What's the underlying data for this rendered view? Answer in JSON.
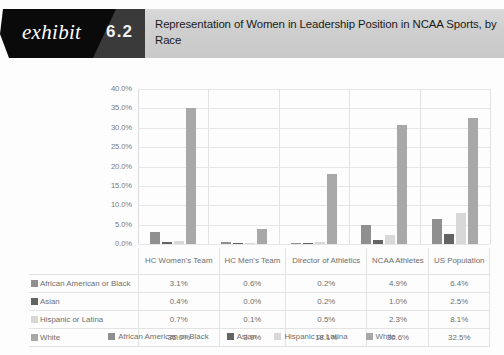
{
  "header": {
    "exhibit_word": "exhibit",
    "exhibit_number": "6.2",
    "title": "Representation of Women in Leadership Position in NCAA Sports, by Race"
  },
  "chart_data": {
    "type": "bar",
    "title": "Representation of Women in Leadership Position in NCAA Sports, by Race",
    "xlabel": "",
    "ylabel": "",
    "ylim": [
      0,
      40
    ],
    "grid": true,
    "legend_position": "bottom",
    "ytick_labels": [
      "40.0%",
      "35.0%",
      "30.0%",
      "25.0%",
      "20.0%",
      "15.0%",
      "10.0%",
      "5.0%",
      "0.0%"
    ],
    "ytick_values": [
      40,
      35,
      30,
      25,
      20,
      15,
      10,
      5,
      0
    ],
    "categories": [
      "HC Women's Team",
      "HC Men's Team",
      "Director of Athletics",
      "NCAA Athletes",
      "US Population"
    ],
    "series": [
      {
        "name": "African American or Black",
        "color": "#8f8f8f",
        "values": [
          3.1,
          0.6,
          0.2,
          4.9,
          6.4
        ],
        "labels": [
          "3.1%",
          "0.6%",
          "0.2%",
          "4.9%",
          "6.4%"
        ]
      },
      {
        "name": "Asian",
        "color": "#636363",
        "values": [
          0.4,
          0.0,
          0.2,
          1.0,
          2.5
        ],
        "labels": [
          "0.4%",
          "0.0%",
          "0.2%",
          "1.0%",
          "2.5%"
        ]
      },
      {
        "name": "Hispanic or Latina",
        "color": "#d8d8d8",
        "values": [
          0.7,
          0.1,
          0.5,
          2.3,
          8.1
        ],
        "labels": [
          "0.7%",
          "0.1%",
          "0.5%",
          "2.3%",
          "8.1%"
        ]
      },
      {
        "name": "White",
        "color": "#a8a8a8",
        "values": [
          35.0,
          3.9,
          18.1,
          30.6,
          32.5
        ],
        "labels": [
          "35.0%",
          "3.9%",
          "18.1%",
          "30.6%",
          "32.5%"
        ]
      }
    ]
  },
  "table": {
    "column_headers": [
      "HC Women's Team",
      "HC Men's Team",
      "Director of Athletics",
      "NCAA Athletes",
      "US Population"
    ],
    "rows": [
      {
        "label": "African American or Black",
        "color": "#8f8f8f",
        "values": [
          "3.1%",
          "0.6%",
          "0.2%",
          "4.9%",
          "6.4%"
        ]
      },
      {
        "label": "Asian",
        "color": "#636363",
        "values": [
          "0.4%",
          "0.0%",
          "0.2%",
          "1.0%",
          "2.5%"
        ]
      },
      {
        "label": "Hispanic or Latina",
        "color": "#d8d8d8",
        "values": [
          "0.7%",
          "0.1%",
          "0.5%",
          "2.3%",
          "8.1%"
        ]
      },
      {
        "label": "White",
        "color": "#a8a8a8",
        "values": [
          "35.0%",
          "3.9%",
          "18.1%",
          "30.6%",
          "32.5%"
        ]
      }
    ]
  },
  "legend": {
    "items": [
      {
        "label": "African American or Black",
        "color": "#8f8f8f"
      },
      {
        "label": "Asian",
        "color": "#636363"
      },
      {
        "label": "Hispanic or Latina",
        "color": "#d8d8d8"
      },
      {
        "label": "White",
        "color": "#a8a8a8"
      }
    ]
  }
}
